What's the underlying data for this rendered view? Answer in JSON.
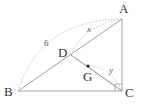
{
  "figure": {
    "type": "geometry-diagram",
    "vertices": {
      "A": {
        "label": "A",
        "x": 122,
        "y": 19
      },
      "B": {
        "label": "B",
        "x": 18,
        "y": 91
      },
      "C": {
        "label": "C",
        "x": 122,
        "y": 91
      },
      "D": {
        "label": "D",
        "x": 71,
        "y": 55
      },
      "G": {
        "label": "G",
        "x": 88,
        "y": 66
      }
    },
    "segments": [
      "AB",
      "BC",
      "CA",
      "DC"
    ],
    "right_angle_at": "C",
    "measure_labels": {
      "AB_length": "6",
      "AD_length": "x",
      "GC_length": "y"
    },
    "colors": {
      "line": "#999999",
      "dotted": "#bbbbbb",
      "point": "#222222",
      "text": "#333333"
    }
  }
}
